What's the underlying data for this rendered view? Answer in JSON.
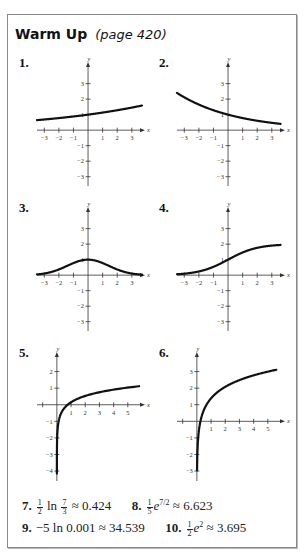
{
  "header": {
    "title": "Warm Up",
    "page_ref": "(page 420)"
  },
  "chart_data": [
    {
      "type": "line",
      "label": "1.",
      "function": "y = e^(x/8)",
      "xlim": [
        -3.5,
        3.7
      ],
      "ylim": [
        -3.6,
        4.2
      ],
      "xticks": [
        -3,
        -2,
        -1,
        1,
        2,
        3
      ],
      "yticks": [
        -3,
        -2,
        -1,
        1,
        2,
        3
      ],
      "xlabel": "x",
      "ylabel": "y",
      "domain": [
        -3.5,
        3.7
      ]
    },
    {
      "type": "line",
      "label": "2.",
      "function": "y = e^(-x/4)",
      "xlim": [
        -3.5,
        3.7
      ],
      "ylim": [
        -3.6,
        4.2
      ],
      "xticks": [
        -3,
        -2,
        -1,
        1,
        2,
        3
      ],
      "yticks": [
        -3,
        -2,
        -1,
        1,
        2,
        3
      ],
      "xlabel": "x",
      "ylabel": "y",
      "domain": [
        -3.5,
        3.6
      ]
    },
    {
      "type": "line",
      "label": "3.",
      "function": "y = e^(-x^2/4)",
      "xlim": [
        -3.5,
        3.7
      ],
      "ylim": [
        -3.6,
        4.2
      ],
      "xticks": [
        -3,
        -2,
        -1,
        1,
        2,
        3
      ],
      "yticks": [
        -3,
        -2,
        -1,
        1,
        2,
        3
      ],
      "xlabel": "x",
      "ylabel": "y",
      "domain": [
        -3.5,
        3.7
      ]
    },
    {
      "type": "line",
      "label": "4.",
      "function": "y = 2/(1+e^(-x))",
      "xlim": [
        -3.5,
        3.7
      ],
      "ylim": [
        -3.6,
        4.2
      ],
      "xticks": [
        -3,
        -2,
        -1,
        1,
        2,
        3
      ],
      "yticks": [
        -3,
        -2,
        -1,
        1,
        2,
        3
      ],
      "xlabel": "x",
      "ylabel": "y",
      "domain": [
        -3.5,
        3.6
      ]
    },
    {
      "type": "line",
      "label": "5.",
      "function": "y = 0.55 ln x + 0.15",
      "xlim": [
        -1.4,
        6.0
      ],
      "ylim": [
        -4.6,
        3.0
      ],
      "xticks": [
        1,
        2,
        3,
        4,
        5
      ],
      "xticks_minor": [
        -1
      ],
      "yticks": [
        -4,
        -3,
        -2,
        -1,
        1,
        2
      ],
      "xlabel": "x",
      "ylabel": "y",
      "domain": [
        0.0004,
        5.8
      ]
    },
    {
      "type": "line",
      "label": "6.",
      "function": "y = ln(4x)",
      "xlim": [
        -1.4,
        6.0
      ],
      "ylim": [
        -3.6,
        4.0
      ],
      "xticks": [
        1,
        2,
        3,
        4,
        5
      ],
      "xticks_minor": [
        -1
      ],
      "yticks": [
        -3,
        -2,
        -1,
        1,
        2,
        3
      ],
      "xlabel": "x",
      "ylabel": "y",
      "domain": [
        0.013,
        5.6
      ]
    }
  ],
  "answers": [
    {
      "num": "7.",
      "pre": "",
      "frac": [
        "1",
        "2"
      ],
      "expr": " ln ",
      "frac2": [
        "7",
        "3"
      ],
      "post": " ≈ 0.424"
    },
    {
      "num": "8.",
      "pre": "",
      "frac": [
        "1",
        "5"
      ],
      "expr": "e",
      "sup": "7/2",
      "post": " ≈ 6.623"
    },
    {
      "num": "9.",
      "text": "−5 ln 0.001 ≈ 34.539"
    },
    {
      "num": "10.",
      "pre": "",
      "frac": [
        "1",
        "2"
      ],
      "expr": "e",
      "sup": "2",
      "post": " ≈ 3.695"
    }
  ]
}
